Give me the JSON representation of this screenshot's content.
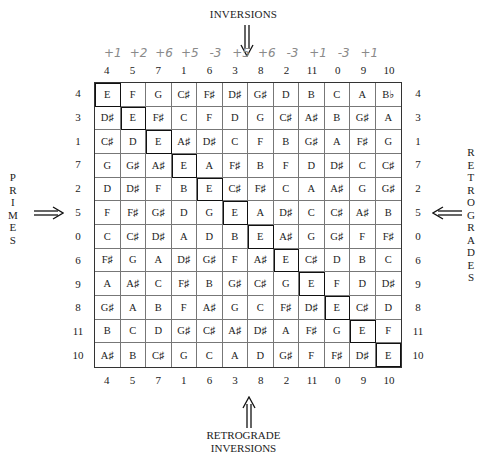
{
  "labels": {
    "inversions": "INVERSIONS",
    "retrograde_inversions_line1": "RETROGRADE",
    "retrograde_inversions_line2": "INVERSIONS",
    "primes": [
      "P",
      "R",
      "I",
      "M",
      "E",
      "S"
    ],
    "retrogrades": [
      "R",
      "E",
      "T",
      "R",
      "O",
      "G",
      "R",
      "A",
      "D",
      "E",
      "S"
    ]
  },
  "handwritten_intervals": [
    "+1",
    "+2",
    "+6",
    "+5",
    "-3",
    "+5",
    "+6",
    "-3",
    "+1",
    "-3",
    "+1"
  ],
  "column_numbers_top": [
    "4",
    "5",
    "7",
    "1",
    "6",
    "3",
    "8",
    "2",
    "11",
    "0",
    "9",
    "10"
  ],
  "column_numbers_bottom": [
    "4",
    "5",
    "7",
    "1",
    "6",
    "3",
    "8",
    "2",
    "11",
    "0",
    "9",
    "10"
  ],
  "row_numbers_left": [
    "4",
    "3",
    "1",
    "7",
    "2",
    "5",
    "0",
    "6",
    "9",
    "8",
    "11",
    "10"
  ],
  "row_numbers_right": [
    "4",
    "3",
    "1",
    "7",
    "2",
    "5",
    "0",
    "6",
    "9",
    "8",
    "11",
    "10"
  ],
  "matrix": [
    [
      "E",
      "F",
      "G",
      "C♯",
      "F♯",
      "D♯",
      "G♯",
      "D",
      "B",
      "C",
      "A",
      "B♭"
    ],
    [
      "D♯",
      "E",
      "F♯",
      "C",
      "F",
      "D",
      "G",
      "C♯",
      "A♯",
      "B",
      "G♯",
      "A"
    ],
    [
      "C♯",
      "D",
      "E",
      "A♯",
      "D♯",
      "C",
      "F",
      "B",
      "G♯",
      "A",
      "F♯",
      "G"
    ],
    [
      "G",
      "G♯",
      "A♯",
      "E",
      "A",
      "F♯",
      "B",
      "F",
      "D",
      "D♯",
      "C",
      "C♯"
    ],
    [
      "D",
      "D♯",
      "F",
      "B",
      "E",
      "C♯",
      "F♯",
      "C",
      "A",
      "A♯",
      "G",
      "G♯"
    ],
    [
      "F",
      "F♯",
      "G♯",
      "D",
      "G",
      "E",
      "A",
      "D♯",
      "C",
      "C♯",
      "A♯",
      "B"
    ],
    [
      "C",
      "C♯",
      "D♯",
      "A",
      "D",
      "B",
      "E",
      "A♯",
      "G",
      "G♯",
      "F",
      "F♯"
    ],
    [
      "F♯",
      "G",
      "A",
      "D♯",
      "G♯",
      "F",
      "A♯",
      "E",
      "C♯",
      "D",
      "B",
      "C"
    ],
    [
      "A",
      "A♯",
      "C",
      "F♯",
      "B",
      "G♯",
      "C♯",
      "G",
      "E",
      "F",
      "D",
      "D♯"
    ],
    [
      "G♯",
      "A",
      "B",
      "F",
      "A♯",
      "G",
      "C",
      "F♯",
      "D♯",
      "E",
      "C♯",
      "D"
    ],
    [
      "B",
      "C",
      "D",
      "G♯",
      "C♯",
      "A♯",
      "D♯",
      "A",
      "F♯",
      "G",
      "E",
      "F"
    ],
    [
      "A♯",
      "B",
      "C♯",
      "G",
      "C",
      "A",
      "D",
      "G♯",
      "F",
      "F♯",
      "D♯",
      "E"
    ]
  ],
  "highlight_color": "#111111"
}
